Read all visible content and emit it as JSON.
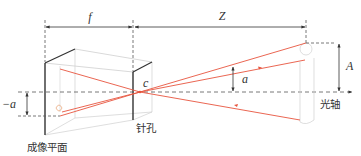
{
  "diagram": {
    "colors": {
      "ray": "#e8553e",
      "line": "#333333",
      "faint": "#c8c8c8",
      "dashed": "#555555"
    },
    "labels": {
      "focal_length": "f",
      "distance": "Z",
      "pinhole_center": "c",
      "image_height": "a",
      "object_height": "A",
      "inverted_image_height": "−a",
      "optical_axis": "光轴",
      "pinhole": "针孔",
      "image_plane": "成像平面"
    }
  }
}
